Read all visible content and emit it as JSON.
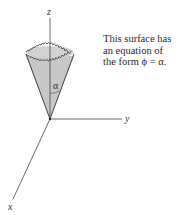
{
  "figure": {
    "axes": {
      "x_label": "x",
      "y_label": "y",
      "z_label": "z"
    },
    "cone": {
      "angle_label": "α",
      "fill_color": "#c8c8c8",
      "edge_color": "#333333"
    },
    "caption": {
      "lines": [
        "This surface has",
        "an equation of",
        "the form ϕ = α."
      ]
    }
  }
}
